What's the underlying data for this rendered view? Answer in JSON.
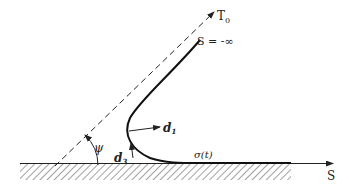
{
  "diagram": {
    "type": "peeling / contact geometry sketch",
    "labels": {
      "tension_direction": "T",
      "tension_subscript": "0",
      "far_field": "S = -∞",
      "normal_vector": "d",
      "normal_subscript": "1",
      "tangent_vector": "d",
      "tangent_subscript": "3",
      "angle": "ψ",
      "contact_point": "σ(t)",
      "axis": "S"
    },
    "colors": {
      "stroke": "#222222",
      "background": "#ffffff"
    }
  }
}
